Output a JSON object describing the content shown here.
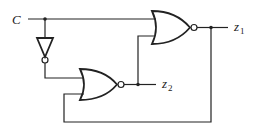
{
  "diagram": {
    "type": "logic-circuit",
    "input": {
      "label": "C"
    },
    "outputs": [
      {
        "label": "z",
        "subscript": "1"
      },
      {
        "label": "z",
        "subscript": "2"
      }
    ],
    "gates": [
      {
        "id": "nor1",
        "type": "NOR",
        "inputs": [
          "C",
          "z2"
        ],
        "output": "z1"
      },
      {
        "id": "nor2",
        "type": "NOR",
        "inputs": [
          "C'",
          "z1"
        ],
        "output": "z2"
      },
      {
        "id": "inv",
        "type": "NOT",
        "inputs": [
          "C"
        ],
        "output": "C'"
      }
    ],
    "colors": {
      "line": "#222222",
      "background": "#ffffff"
    }
  }
}
